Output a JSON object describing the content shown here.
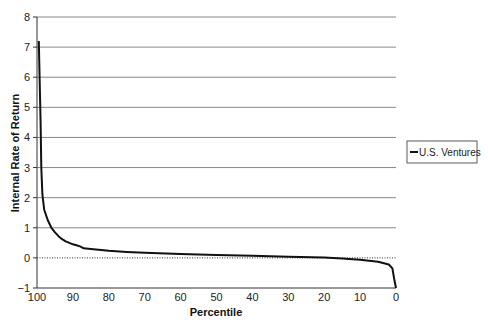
{
  "chart_data": {
    "type": "line",
    "title": "",
    "xlabel": "Percentile",
    "ylabel": "Internal Rate of Return",
    "xlim": [
      100,
      0
    ],
    "ylim": [
      -1,
      8
    ],
    "x_ticks": [
      100,
      90,
      80,
      70,
      60,
      50,
      40,
      30,
      20,
      10,
      0
    ],
    "y_ticks": [
      -1,
      0,
      1,
      2,
      3,
      4,
      5,
      6,
      7,
      8
    ],
    "y_tick_labels": [
      "−1",
      "0",
      "1",
      "2",
      "3",
      "4",
      "5",
      "6",
      "7",
      "8"
    ],
    "grid": "horizontal",
    "zero_line": "dotted",
    "legend_position": "right",
    "series": [
      {
        "name": "U.S. Ventures",
        "color": "#111111",
        "x": [
          99.5,
          99,
          98.8,
          98.5,
          98,
          97,
          96,
          95,
          94,
          93,
          92,
          91,
          90,
          89,
          88,
          87,
          85,
          80,
          75,
          70,
          60,
          50,
          40,
          30,
          20,
          15,
          10,
          5,
          2,
          1,
          0.5,
          0
        ],
        "values": [
          7.2,
          4.5,
          3.0,
          2.1,
          1.6,
          1.25,
          1.0,
          0.85,
          0.72,
          0.62,
          0.55,
          0.5,
          0.45,
          0.42,
          0.38,
          0.32,
          0.3,
          0.24,
          0.2,
          0.17,
          0.13,
          0.1,
          0.07,
          0.04,
          0.01,
          -0.02,
          -0.06,
          -0.13,
          -0.22,
          -0.35,
          -0.7,
          -1.0
        ]
      }
    ]
  },
  "legend": {
    "label": "U.S. Ventures"
  },
  "axes": {
    "xlabel": "Percentile",
    "ylabel": "Internal Rate of Return"
  }
}
